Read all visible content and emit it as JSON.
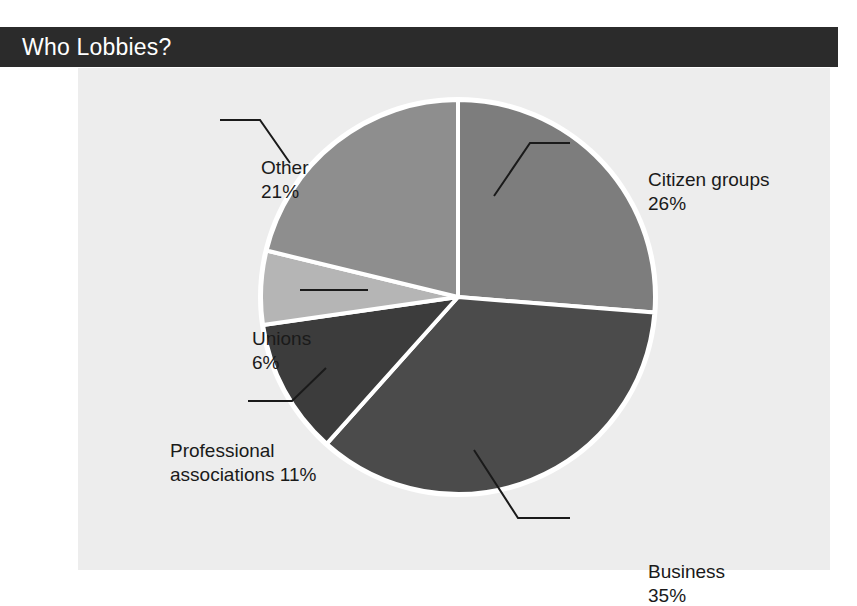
{
  "figure": {
    "title": "Who Lobbies?",
    "background_color": "#ffffff",
    "panel_color": "#ededed",
    "title_bar_color": "#2b2b2b",
    "title_text_color": "#ffffff"
  },
  "chart_data": {
    "type": "pie",
    "title": "Who Lobbies?",
    "xlabel": "",
    "ylabel": "",
    "categories": [
      "Citizen groups",
      "Business",
      "Professional associations",
      "Unions",
      "Other"
    ],
    "values": [
      26,
      35,
      11,
      6,
      21
    ],
    "unit": "percent",
    "total": 99,
    "start_angle_deg": 0,
    "direction": "clockwise",
    "legend": "none",
    "grid": false,
    "slice_colors": [
      "#7d7d7d",
      "#4b4b4b",
      "#3c3c3c",
      "#b5b5b5",
      "#8e8e8e"
    ],
    "slice_separator_color": "#ffffff",
    "slices": [
      {
        "label": "Citizen groups",
        "value": 26,
        "display": "26%",
        "color": "#7d7d7d"
      },
      {
        "label": "Business",
        "value": 35,
        "display": "35%",
        "color": "#4b4b4b"
      },
      {
        "label": "Professional associations",
        "value": 11,
        "display": "11%",
        "color": "#3c3c3c"
      },
      {
        "label": "Unions",
        "value": 6,
        "display": "6%",
        "color": "#b5b5b5"
      },
      {
        "label": "Other",
        "value": 21,
        "display": "21%",
        "color": "#8e8e8e"
      }
    ]
  },
  "callouts": {
    "other": {
      "name": "Other",
      "value": "21%"
    },
    "citizen": {
      "name": "Citizen groups",
      "value": "26%"
    },
    "unions": {
      "name": "Unions",
      "value": "6%"
    },
    "professional": {
      "line1": "Professional",
      "line2": "associations 11%"
    },
    "business": {
      "name": "Business",
      "value": "35%"
    }
  }
}
